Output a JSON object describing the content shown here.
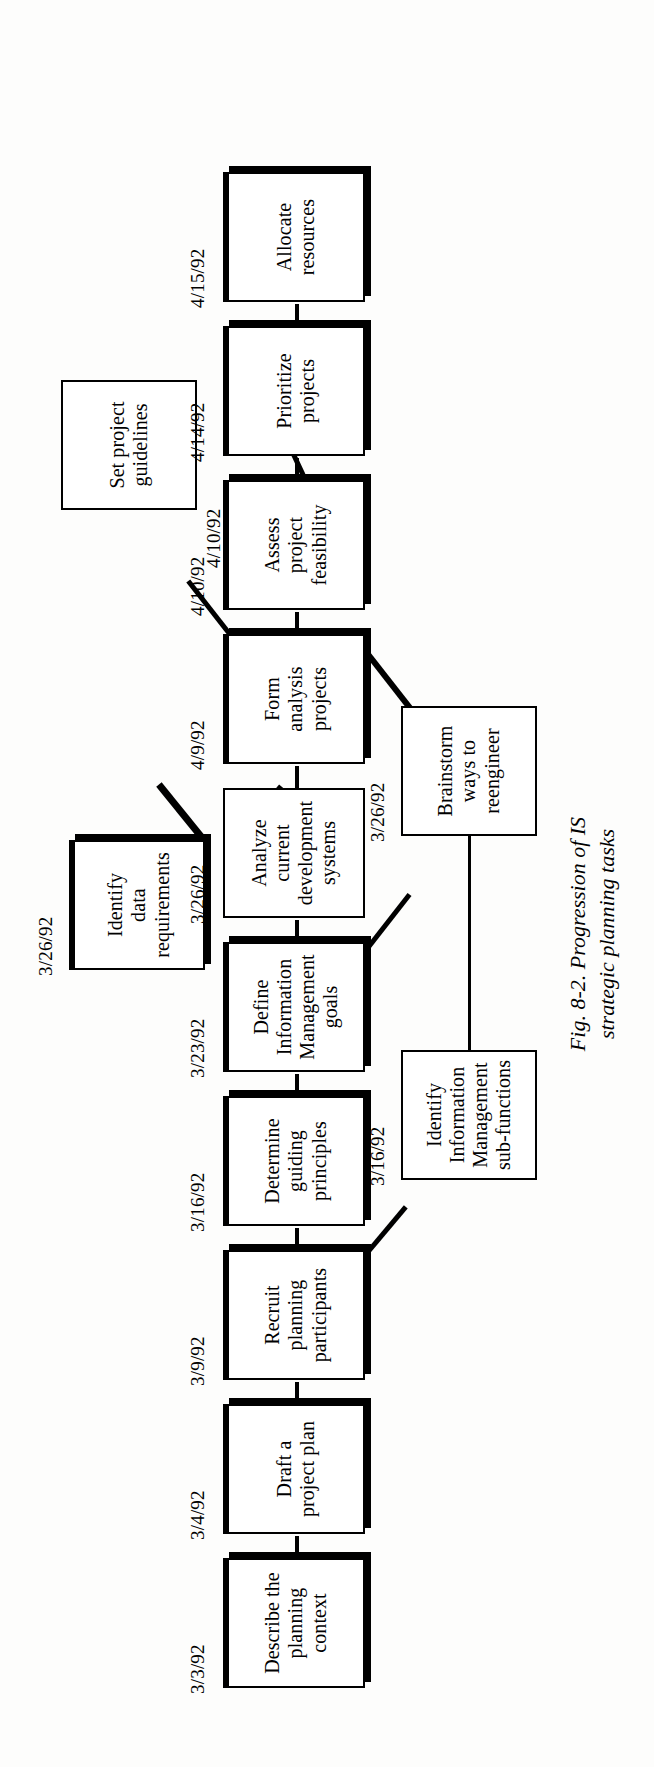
{
  "figure": {
    "caption_label": "Fig. 8-2.",
    "caption_text": "Progression of IS\nstrategic planning tasks",
    "caption_full": "Fig. 8-2.  Progression of IS\nstrategic planning tasks",
    "orientation": "rotated-90-ccw",
    "ink_color": "#000000",
    "paper_color": "#fdfdfc"
  },
  "chart_data": {
    "type": "diagram",
    "title": "Progression of IS strategic planning tasks",
    "nodes": [
      {
        "id": "n1",
        "label": "Describe the\nplanning\ncontext",
        "date": "3/3/92",
        "lane": "main",
        "style": "shadow"
      },
      {
        "id": "n2",
        "label": "Draft a\nproject plan",
        "date": "3/4/92",
        "lane": "main",
        "style": "shadow"
      },
      {
        "id": "n3",
        "label": "Recruit\nplanning\nparticipants",
        "date": "3/9/92",
        "lane": "main",
        "style": "shadow"
      },
      {
        "id": "n4",
        "label": "Determine\nguiding\nprinciples",
        "date": "3/16/92",
        "lane": "main",
        "style": "shadow"
      },
      {
        "id": "n5",
        "label": "Define\nInformation\nManagement\ngoals",
        "date": "3/23/92",
        "lane": "main",
        "style": "shadow"
      },
      {
        "id": "n6",
        "label": "Analyze\ncurrent\ndevelopment\nsystems",
        "date": "3/26/92",
        "lane": "main",
        "style": "plain"
      },
      {
        "id": "n7",
        "label": "Form\nanalysis\nprojects",
        "date": "4/9/92",
        "lane": "main",
        "style": "shadow"
      },
      {
        "id": "n8",
        "label": "Assess\nproject\nfeasibility",
        "date": "4/10/92",
        "lane": "main",
        "style": "shadow"
      },
      {
        "id": "n9",
        "label": "Prioritize\nprojects",
        "date": "4/14/92",
        "lane": "main",
        "style": "shadow"
      },
      {
        "id": "n10",
        "label": "Allocate\nresources",
        "date": "4/15/92",
        "lane": "main",
        "style": "shadow"
      },
      {
        "id": "b1",
        "label": "Identify\nInformation\nManagement\nsub-functions",
        "date": "3/16/92",
        "lane": "lower",
        "style": "plain"
      },
      {
        "id": "b2",
        "label": "Brainstorm\nways to\nreengineer",
        "date": "3/26/92",
        "lane": "lower",
        "style": "plain"
      },
      {
        "id": "b3",
        "label": "Set project\nguidelines",
        "date": "4/10/92",
        "lane": "lower",
        "style": "plain"
      },
      {
        "id": "b4",
        "label": "Identify\ndata\nrequirements",
        "date": "3/26/92",
        "lane": "upper",
        "style": "shadow"
      }
    ],
    "edges": [
      {
        "from": "n1",
        "to": "n2",
        "kind": "straight"
      },
      {
        "from": "n2",
        "to": "n3",
        "kind": "straight"
      },
      {
        "from": "n3",
        "to": "n4",
        "kind": "straight"
      },
      {
        "from": "n4",
        "to": "n5",
        "kind": "straight"
      },
      {
        "from": "n5",
        "to": "n6",
        "kind": "straight"
      },
      {
        "from": "n6",
        "to": "n7",
        "kind": "straight"
      },
      {
        "from": "n7",
        "to": "n8",
        "kind": "straight"
      },
      {
        "from": "n8",
        "to": "n9",
        "kind": "straight"
      },
      {
        "from": "n9",
        "to": "n10",
        "kind": "straight"
      },
      {
        "from": "n3",
        "to": "b1",
        "kind": "diagonal",
        "date": "3/16/92"
      },
      {
        "from": "n5",
        "to": "b2",
        "kind": "diagonal",
        "date": "3/26/92"
      },
      {
        "from": "n7",
        "to": "b2",
        "kind": "diagonal"
      },
      {
        "from": "n7",
        "to": "b3",
        "kind": "diagonal",
        "date": "4/10/92"
      },
      {
        "from": "n9",
        "to": "b3",
        "kind": "diagonal"
      },
      {
        "from": "b1",
        "to": "b2",
        "kind": "straight"
      },
      {
        "from": "b4",
        "to": "n6",
        "kind": "diagonal",
        "date": "3/26/92"
      },
      {
        "from": "b4",
        "to": "n7",
        "kind": "diagonal",
        "date": "4/9/92"
      }
    ],
    "dates": [
      "3/3/92",
      "3/4/92",
      "3/9/92",
      "3/16/92",
      "3/23/92",
      "3/26/92",
      "4/9/92",
      "4/10/92",
      "4/14/92",
      "4/15/92"
    ]
  }
}
